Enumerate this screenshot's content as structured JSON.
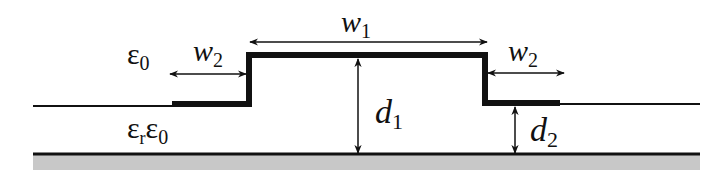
{
  "diagram": {
    "type": "stepped microstrip cross-section",
    "labels": {
      "w1": {
        "base": "w",
        "sub": "1"
      },
      "w2_left": {
        "base": "w",
        "sub": "2"
      },
      "w2_right": {
        "base": "w",
        "sub": "2"
      },
      "d1": {
        "base": "d",
        "sub": "1"
      },
      "d2": {
        "base": "d",
        "sub": "2"
      },
      "eps_air": {
        "base": "ε",
        "sub": "0"
      },
      "eps_sub": {
        "base1": "ε",
        "sub1": "r",
        "base2": "ε",
        "sub2": "0"
      }
    },
    "colors": {
      "line": "#111111",
      "ground": "#c8c8c8",
      "background": "#ffffff"
    }
  }
}
